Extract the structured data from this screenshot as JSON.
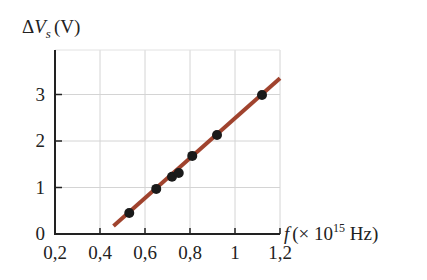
{
  "chart_data": {
    "type": "scatter",
    "title": "",
    "ylabel": "ΔVs (V)",
    "ylabel_parts": {
      "delta": "Δ",
      "var": "V",
      "sub": "s",
      "unit": "(V)"
    },
    "xlabel": "f (× 10^15 Hz)",
    "xlabel_parts": {
      "var": "f",
      "pre": "(× 10",
      "exp": "15",
      "post": " Hz)"
    },
    "xlim": [
      0.2,
      1.2
    ],
    "ylim": [
      0,
      3.7
    ],
    "x_ticks": [
      "0,2",
      "0,4",
      "0,6",
      "0,8",
      "1",
      "1,2"
    ],
    "y_ticks": [
      "0",
      "1",
      "2",
      "3"
    ],
    "grid": true,
    "legend": null,
    "series": [
      {
        "name": "measurements",
        "type": "scatter",
        "color": "#1a1a1a",
        "x": [
          0.53,
          0.65,
          0.72,
          0.75,
          0.81,
          0.92,
          1.12
        ],
        "y": [
          0.45,
          0.97,
          1.23,
          1.31,
          1.68,
          2.13,
          2.99
        ]
      },
      {
        "name": "linear fit",
        "type": "line",
        "color": "#a0432e",
        "x": [
          0.46,
          1.2
        ],
        "y": [
          0.17,
          3.35
        ]
      }
    ]
  }
}
